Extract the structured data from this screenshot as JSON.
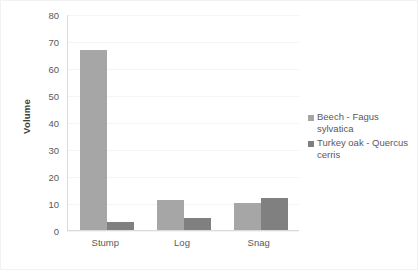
{
  "chart_data": {
    "type": "bar",
    "title": "",
    "xlabel": "",
    "ylabel": "Volume",
    "ylim": [
      0,
      80
    ],
    "yticks": [
      0,
      10,
      20,
      30,
      40,
      50,
      60,
      70,
      80
    ],
    "ytick_labels": [
      "0",
      "10",
      "20",
      "30",
      "40",
      "50",
      "60",
      "70",
      "80"
    ],
    "categories": [
      "Stump",
      "Log",
      "Snag"
    ],
    "grid": true,
    "legend_position": "right",
    "series": [
      {
        "name": "Beech - Fagus sylvatica",
        "color": "#a6a6a6",
        "values": [
          67,
          11,
          10
        ]
      },
      {
        "name": "Turkey oak - Quercus cerris",
        "color": "#808080",
        "values": [
          3,
          4.5,
          12
        ]
      }
    ]
  },
  "colors": {
    "axis": "#d9d9d9",
    "grid": "#f4f4f4",
    "tick_text": "#59595b",
    "axis_title_text": "#3f3f3f",
    "background": "#ffffff",
    "frame": "#f2f2f2"
  }
}
